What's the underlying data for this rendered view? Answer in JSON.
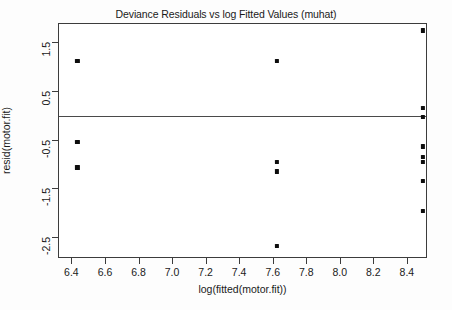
{
  "chart_data": {
    "type": "scatter",
    "title": "Deviance Residuals vs log Fitted Values (muhat)",
    "xlabel": "log(fitted(motor.fit))",
    "ylabel": "resid(motor.fit)",
    "xlim": [
      6.32,
      8.52
    ],
    "ylim": [
      -2.92,
      1.88
    ],
    "xticks": [
      "6.4",
      "6.6",
      "6.8",
      "7.0",
      "7.2",
      "7.4",
      "7.6",
      "7.8",
      "8.0",
      "8.2",
      "8.4"
    ],
    "xtick_values": [
      6.4,
      6.6,
      6.8,
      7.0,
      7.2,
      7.4,
      7.6,
      7.8,
      8.0,
      8.2,
      8.4
    ],
    "yticks": [
      "1.5",
      "0.5",
      "-0.5",
      "-1.5",
      "-2.5"
    ],
    "ytick_values": [
      1.5,
      0.5,
      -0.5,
      -1.5,
      -2.5
    ],
    "grid": false,
    "legend": null,
    "marker": "filled-square",
    "marker_color": "#0d0d0d",
    "reference_line": {
      "orientation": "horizontal",
      "y": 0,
      "color": "#4a4a4a"
    },
    "points": [
      {
        "x": 6.43,
        "y": 1.12
      },
      {
        "x": 6.43,
        "y": -0.52
      },
      {
        "x": 6.43,
        "y": -1.05
      },
      {
        "x": 7.62,
        "y": 1.12
      },
      {
        "x": 7.62,
        "y": -0.93
      },
      {
        "x": 7.62,
        "y": -1.13
      },
      {
        "x": 7.62,
        "y": -2.65
      },
      {
        "x": 8.49,
        "y": 1.75
      },
      {
        "x": 8.49,
        "y": 0.17
      },
      {
        "x": 8.49,
        "y": -0.02
      },
      {
        "x": 8.49,
        "y": -0.62
      },
      {
        "x": 8.49,
        "y": -0.84
      },
      {
        "x": 8.49,
        "y": -0.93
      },
      {
        "x": 8.49,
        "y": -1.32
      },
      {
        "x": 8.49,
        "y": -1.93
      }
    ]
  }
}
